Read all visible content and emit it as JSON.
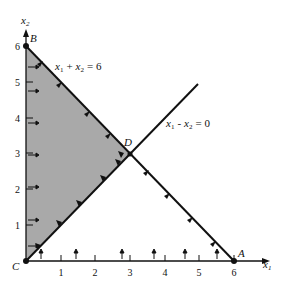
{
  "diagram": {
    "type": "linear-programming-feasible-region",
    "axes": {
      "x_label": "x",
      "x_sub": "1",
      "y_label": "x",
      "y_sub": "2",
      "x_ticks": [
        "1",
        "2",
        "3",
        "4",
        "5",
        "6"
      ],
      "y_ticks": [
        "1",
        "2",
        "3",
        "4",
        "5",
        "6"
      ],
      "range": [
        0,
        6
      ]
    },
    "constraints": [
      {
        "id": "c1",
        "label_a": "x",
        "label_a_sub": "1",
        "op": "+",
        "label_b": "x",
        "label_b_sub": "2",
        "rhs": "= 6",
        "text": "x1 + x2 = 6"
      },
      {
        "id": "c2",
        "label_a": "x",
        "label_a_sub": "1",
        "op": "-",
        "label_b": "x",
        "label_b_sub": "2",
        "rhs": "= 0",
        "text": "x1 - x2 = 0"
      }
    ],
    "points": [
      {
        "name": "A",
        "coords": [
          6,
          0
        ]
      },
      {
        "name": "B",
        "coords": [
          0,
          6
        ]
      },
      {
        "name": "C",
        "coords": [
          0,
          0
        ]
      },
      {
        "name": "D",
        "coords": [
          3,
          3
        ]
      }
    ],
    "feasible_region": {
      "vertices": [
        "C",
        "B",
        "D"
      ],
      "fill": "#a9a9a9"
    },
    "colors": {
      "line": "#111111",
      "shade": "#a9a9a9",
      "background": "#ffffff"
    }
  }
}
